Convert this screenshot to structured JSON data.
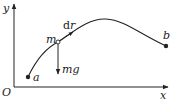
{
  "diagram": {
    "axes": {
      "x_label": "x",
      "y_label": "y",
      "origin_label": "O"
    },
    "points": {
      "start": {
        "label": "a"
      },
      "moving": {
        "label": "m"
      },
      "end": {
        "label": "b"
      }
    },
    "vectors": {
      "displacement": {
        "label_d": "d",
        "label_r": "r"
      },
      "gravity": {
        "label": "mg"
      }
    },
    "colors": {
      "stroke": "#222222",
      "background": "#ffffff"
    }
  }
}
